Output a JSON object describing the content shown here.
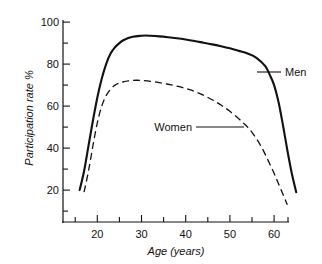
{
  "chart_data": {
    "type": "line",
    "title": "",
    "subtitle": "",
    "xlabel": "Age (years)",
    "ylabel": "Participation rate %",
    "xlim": [
      13,
      66
    ],
    "ylim": [
      6,
      102
    ],
    "xticks": [
      20,
      30,
      40,
      50,
      60
    ],
    "xtick_labels": [
      "20",
      "30",
      "40",
      "50",
      "60"
    ],
    "xminor_ticks": [
      15,
      25,
      35,
      45,
      55,
      65
    ],
    "yticks": [
      20,
      40,
      60,
      80,
      100
    ],
    "ytick_labels": [
      "20",
      "40",
      "60",
      "80",
      "100"
    ],
    "yminor_ticks": [
      10,
      30,
      50,
      70,
      90
    ],
    "grid": false,
    "legend_position": "inline-annotation",
    "series": [
      {
        "name": "Men",
        "style": "solid",
        "color": "#111111",
        "x": [
          16,
          17,
          18,
          19,
          20,
          21,
          22,
          23,
          24,
          25,
          26,
          28,
          30,
          31,
          32,
          34,
          36,
          38,
          40,
          42,
          44,
          46,
          48,
          50,
          52,
          54,
          56,
          58,
          59,
          60,
          61,
          62,
          63,
          64,
          65
        ],
        "y": [
          20,
          29,
          41,
          53,
          64,
          73,
          80,
          85,
          88,
          90,
          91.5,
          93,
          93.5,
          93.6,
          93.5,
          93.2,
          92.8,
          92.3,
          91.7,
          91,
          90.2,
          89.4,
          88.5,
          87.5,
          86.3,
          85,
          83,
          79,
          75,
          70,
          62,
          51,
          39,
          28,
          19
        ]
      },
      {
        "name": "Women",
        "style": "dashed",
        "color": "#111111",
        "x": [
          17,
          18,
          19,
          20,
          21,
          22,
          23,
          24,
          25,
          26,
          27,
          28,
          29,
          30,
          32,
          34,
          36,
          38,
          40,
          42,
          44,
          46,
          48,
          50,
          52,
          53,
          54,
          55,
          56,
          57,
          58,
          59,
          60,
          61,
          62,
          63
        ],
        "y": [
          19,
          29,
          41,
          52,
          60,
          65,
          68,
          70,
          71,
          71.6,
          72,
          72.2,
          72.3,
          72.2,
          71.8,
          71.2,
          70.4,
          69.5,
          68.4,
          67,
          65.2,
          63,
          60.5,
          57.5,
          54,
          52,
          50,
          47.5,
          44.5,
          41,
          37,
          32.5,
          28,
          23,
          18,
          13
        ]
      }
    ],
    "annotations": [
      {
        "label": "Men",
        "points_to_series": "Men",
        "at_age": 58,
        "at_value": 76
      },
      {
        "label": "Women",
        "points_to_series": "Women",
        "at_age": 54,
        "at_value": 50
      }
    ]
  }
}
